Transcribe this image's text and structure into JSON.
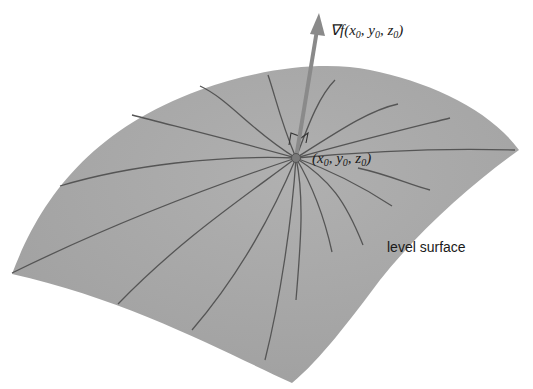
{
  "diagram": {
    "labels": {
      "gradient": "∇f(x₀, y₀, z₀)",
      "gradient_prefix": "∇f(",
      "gradient_args": [
        "x",
        "y",
        "z"
      ],
      "subscript": "0",
      "point": "(x₀, y₀, z₀)",
      "surface": "level surface"
    },
    "colors": {
      "surface_fill": "#a9a9a9",
      "surface_shade": "#9a9a9a",
      "curve_stroke": "#555555",
      "arrow": "#8a8a8a",
      "text": "#1a1a1a",
      "background": "#ffffff"
    },
    "point": {
      "x": 296,
      "y": 158
    },
    "arrow": {
      "from": [
        296,
        158
      ],
      "to": [
        319,
        12
      ]
    },
    "curve_count": 18
  }
}
